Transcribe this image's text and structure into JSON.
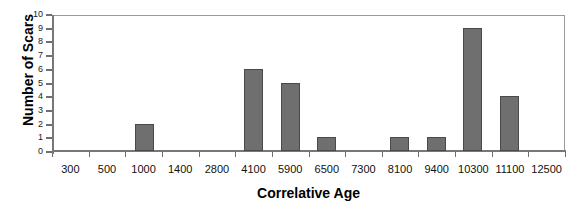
{
  "chart_data": {
    "type": "bar",
    "title": "",
    "xlabel": "Correlative Age",
    "ylabel": "Number of Scars",
    "categories": [
      "300",
      "500",
      "1000",
      "1400",
      "2800",
      "4100",
      "5900",
      "6500",
      "7300",
      "8100",
      "9400",
      "10300",
      "11100",
      "12500"
    ],
    "values": [
      0,
      0,
      2,
      0,
      0,
      6,
      5,
      1,
      0,
      1,
      1,
      9,
      4,
      0
    ],
    "ylim": [
      0,
      10
    ],
    "yticks": [
      "0",
      "1",
      "2",
      "3",
      "4",
      "5",
      "6",
      "7",
      "8",
      "9",
      "10"
    ],
    "grid": false,
    "legend": null,
    "bar_color": "#6f6f6f",
    "bar_edge_color": "#4a4a4a",
    "frame_color": "#9a9a9a",
    "background": "#ffffff"
  }
}
